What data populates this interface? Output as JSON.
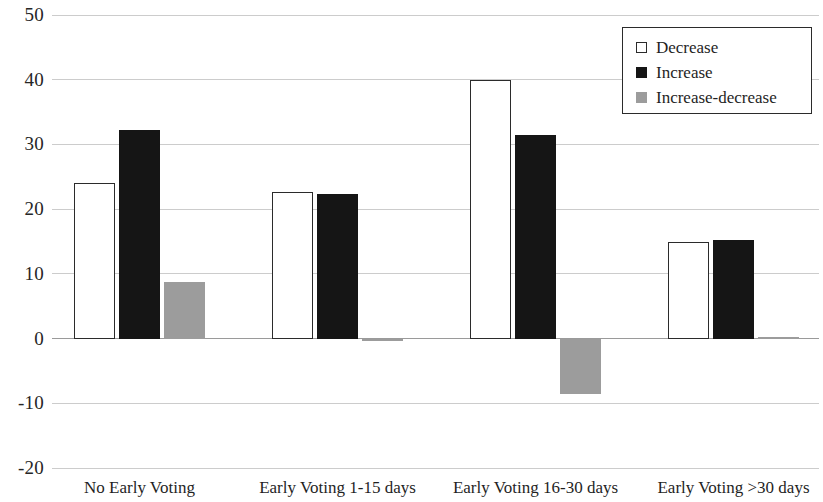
{
  "chart_data": {
    "type": "bar",
    "title": "",
    "subtitle": "",
    "xlabel": "",
    "ylabel": "",
    "ylim": [
      -20,
      50
    ],
    "yticks": [
      50,
      40,
      30,
      20,
      10,
      0,
      -10,
      -20
    ],
    "ytick_labels": [
      "50",
      "40",
      "30",
      "20",
      "10",
      "0",
      "-10",
      "-20"
    ],
    "grid": true,
    "legend_position": "top-right",
    "categories": [
      "No Early Voting",
      "Early Voting 1-15 days",
      "Early Voting 16-30 days",
      "Early Voting >30 days"
    ],
    "series": [
      {
        "name": "Decrease",
        "color": "#ffffff",
        "edge_color": "#2b2b2b",
        "values": [
          24.0,
          22.7,
          40.0,
          14.9
        ]
      },
      {
        "name": "Increase",
        "color": "#151515",
        "edge_color": "#151515",
        "values": [
          32.3,
          22.3,
          31.5,
          15.2
        ]
      },
      {
        "name": "Increase-decrease",
        "color": "#9c9c9c",
        "edge_color": "#9c9c9c",
        "values": [
          8.7,
          -0.2,
          -8.5,
          0.2
        ]
      }
    ]
  },
  "legend": {
    "items": [
      {
        "label": "Decrease",
        "swatch": "open-square-icon"
      },
      {
        "label": "Increase",
        "swatch": "filled-black-square-icon"
      },
      {
        "label": "Increase-decrease",
        "swatch": "filled-gray-square-icon"
      }
    ]
  }
}
